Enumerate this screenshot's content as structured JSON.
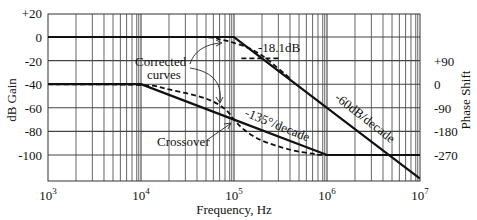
{
  "chart_data": {
    "type": "line",
    "title": "",
    "xlabel": "Frequency, Hz",
    "ylabel": "dB Gain",
    "y2label": "Phase Shift",
    "xscale": "log",
    "xlim": [
      1000,
      10000000
    ],
    "ylim": [
      -120,
      20
    ],
    "y2lim": [
      -270,
      90
    ],
    "grid": true,
    "x_ticks": [
      {
        "value": 1000,
        "base": "10",
        "exp": "3"
      },
      {
        "value": 10000,
        "base": "10",
        "exp": "4"
      },
      {
        "value": 100000,
        "base": "10",
        "exp": "5"
      },
      {
        "value": 1000000,
        "base": "10",
        "exp": "6"
      },
      {
        "value": 10000000,
        "base": "10",
        "exp": "7"
      }
    ],
    "y_ticks": [
      "+20",
      "0",
      "-20",
      "-40",
      "-60",
      "-80",
      "-100"
    ],
    "y_tick_values": [
      20,
      0,
      -20,
      -40,
      -60,
      -80,
      -100
    ],
    "y2_ticks": [
      "+90",
      "0",
      "-90",
      "-180",
      "-270"
    ],
    "y2_tick_values": [
      90,
      0,
      -90,
      -180,
      -270
    ],
    "series": [
      {
        "name": "Gain asymptote",
        "axis": "left",
        "style": "solid",
        "x": [
          1000,
          100000,
          1000000,
          10000000
        ],
        "values": [
          0,
          0,
          -60,
          -120
        ]
      },
      {
        "name": "Gain corrected curve",
        "axis": "left",
        "style": "dashed",
        "x": [
          1000,
          40000,
          70000,
          100000,
          150000,
          220000,
          400000
        ],
        "values": [
          0,
          0,
          -2,
          -5,
          -10,
          -18.1,
          -35
        ]
      },
      {
        "name": "Phase asymptote",
        "axis": "right",
        "style": "solid",
        "x": [
          1000,
          10000,
          100000,
          1000000,
          10000000
        ],
        "values": [
          0,
          0,
          -135,
          -270,
          -270
        ]
      },
      {
        "name": "Phase corrected curve",
        "axis": "right",
        "style": "dashed",
        "x": [
          1000,
          10000,
          20000,
          50000,
          80000,
          100000,
          130000,
          200000,
          400000,
          700000,
          1000000,
          10000000
        ],
        "values": [
          0,
          -3,
          -20,
          -55,
          -95,
          -135,
          -175,
          -215,
          -250,
          -265,
          -270,
          -270
        ]
      },
      {
        "name": "-18.1 dB reference",
        "axis": "left",
        "style": "dashed",
        "x": [
          120000,
          320000
        ],
        "values": [
          -18.1,
          -18.1
        ]
      }
    ],
    "annotations": [
      {
        "text": "Corrected",
        "line2": "curves"
      },
      {
        "text": "-18.1dB"
      },
      {
        "text": "-135°/decade"
      },
      {
        "text": "-60dB/decade"
      },
      {
        "text": "Crossover"
      }
    ]
  },
  "labels": {
    "ylabel": "dB Gain",
    "y2label": "Phase Shift",
    "xlabel": "Frequency, Hz",
    "corrected_line1": "Corrected",
    "corrected_line2": "curves",
    "db181": "-18.1dB",
    "phase_slope": "-135°/decade",
    "gain_slope": "-60dB/decade",
    "crossover": "Crossover"
  },
  "colors": {
    "line": "#111111",
    "grid": "#555555",
    "background": "#ffffff"
  }
}
